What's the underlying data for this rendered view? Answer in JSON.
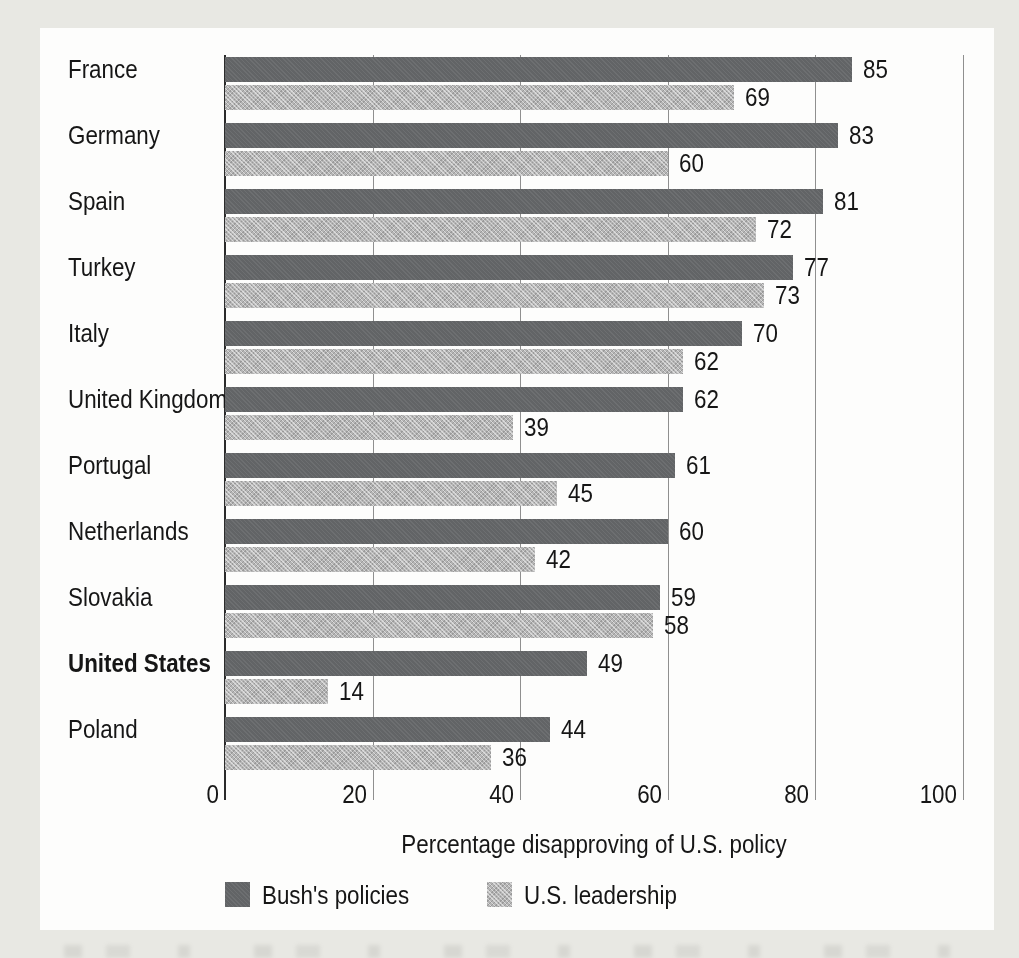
{
  "chart_data": {
    "type": "bar",
    "orientation": "horizontal",
    "title": "",
    "xlabel": "Percentage disapproving of U.S. policy",
    "categories": [
      "France",
      "Germany",
      "Spain",
      "Turkey",
      "Italy",
      "United Kingdom",
      "Portugal",
      "Netherlands",
      "Slovakia",
      "United States",
      "Poland"
    ],
    "emphasized_category": "United States",
    "series": [
      {
        "name": "Bush's policies",
        "values": [
          85,
          83,
          81,
          77,
          70,
          62,
          61,
          60,
          59,
          49,
          44
        ],
        "color": "#626466",
        "texture": "solid"
      },
      {
        "name": "U.S. leadership",
        "values": [
          69,
          60,
          72,
          73,
          62,
          39,
          45,
          42,
          58,
          14,
          36
        ],
        "color": "#b5b5b5",
        "texture": "diagonal-hatch"
      }
    ],
    "xlim": [
      0,
      100
    ],
    "x_ticks": [
      0,
      20,
      40,
      60,
      80,
      100
    ],
    "grid": true,
    "value_labels": true,
    "legend_position": "bottom-left"
  },
  "colors": {
    "page_background": "#e8e8e3",
    "panel_background": "#fdfdfc",
    "dark_bar": "#626466",
    "light_bar": "#b5b5b5",
    "gridline": "#8f8f8f",
    "zero_axis_line": "#2b2b2b",
    "text": "#161616"
  }
}
